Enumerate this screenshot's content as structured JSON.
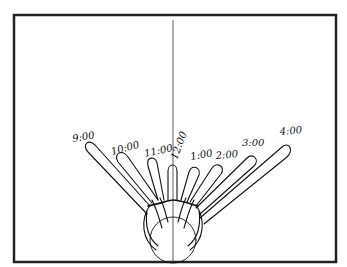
{
  "diagram": {
    "time_labels": [
      {
        "label": "9:00",
        "x": 73,
        "y": 142,
        "rot": -10
      },
      {
        "label": "10:00",
        "x": 112,
        "y": 155,
        "rot": -15
      },
      {
        "label": "11:00",
        "x": 145,
        "y": 157,
        "rot": -12
      },
      {
        "label": "12:00",
        "x": 177,
        "y": 160,
        "rot": -70
      },
      {
        "label": "1:00",
        "x": 191,
        "y": 160,
        "rot": -10
      },
      {
        "label": "2:00",
        "x": 216,
        "y": 159,
        "rot": -5
      },
      {
        "label": "3:00",
        "x": 242,
        "y": 146,
        "rot": 0
      },
      {
        "label": "4:00",
        "x": 280,
        "y": 135,
        "rot": -5
      }
    ],
    "colors": {
      "ink": "#111111",
      "frame": "#222222",
      "background": "#ffffff"
    }
  }
}
